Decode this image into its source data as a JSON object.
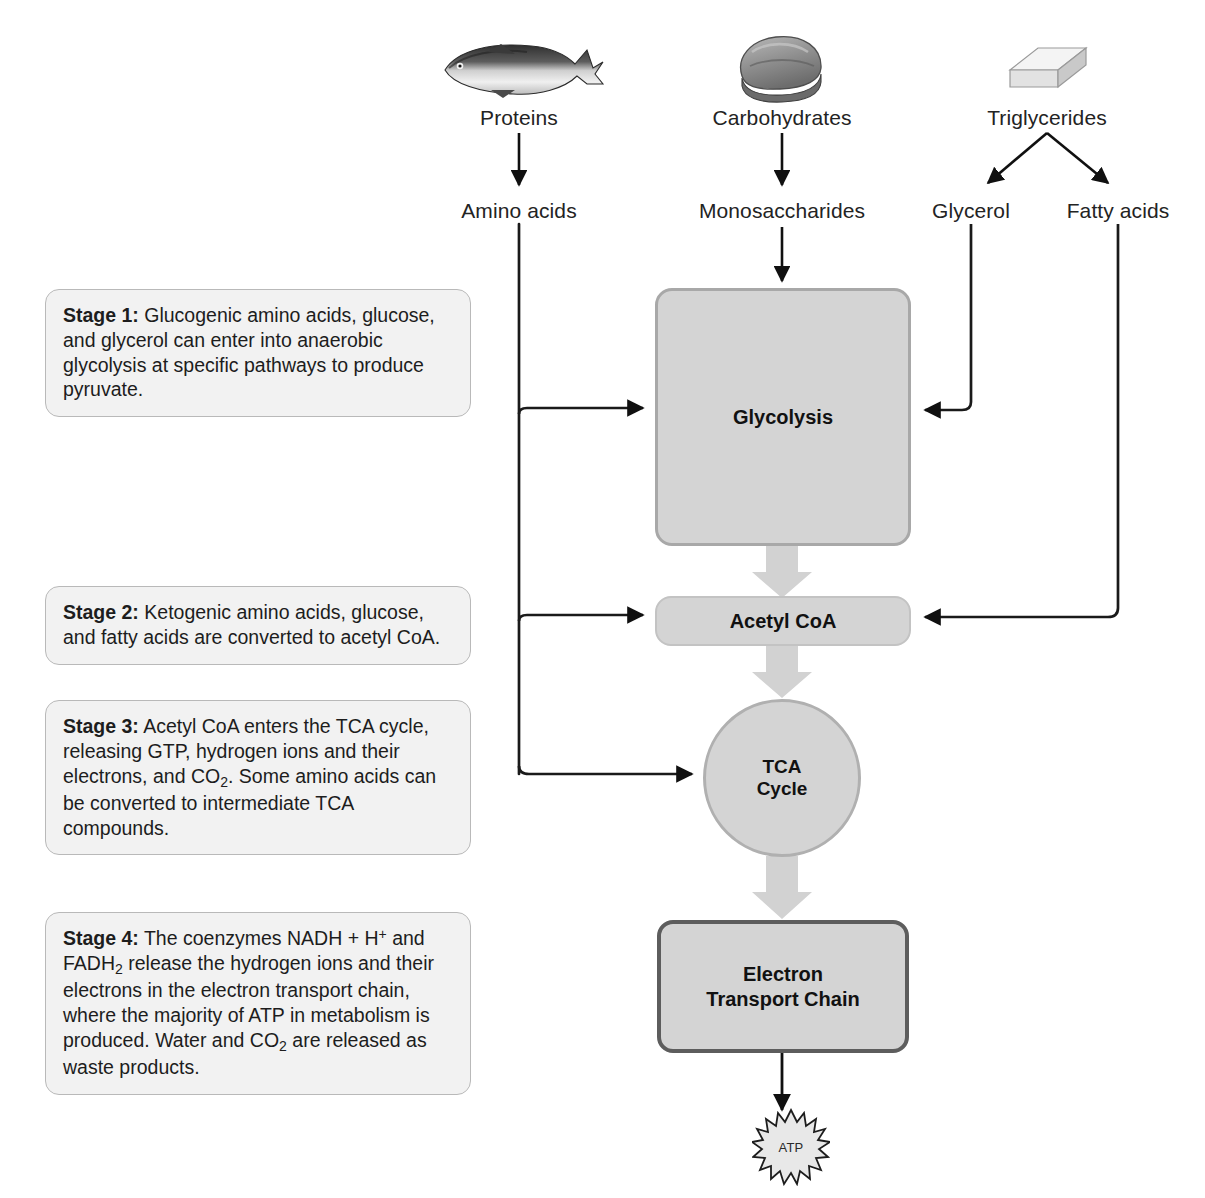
{
  "diagram": {
    "macronutrients": [
      {
        "id": "proteins",
        "label": "Proteins",
        "icon": "fish-icon"
      },
      {
        "id": "carbohydrates",
        "label": "Carbohydrates",
        "icon": "bread-icon"
      },
      {
        "id": "triglycerides",
        "label": "Triglycerides",
        "icon": "butter-icon"
      }
    ],
    "breakdown_products": [
      {
        "id": "amino-acids",
        "label": "Amino acids"
      },
      {
        "id": "monosaccharides",
        "label": "Monosaccharides"
      },
      {
        "id": "glycerol",
        "label": "Glycerol"
      },
      {
        "id": "fatty-acids",
        "label": "Fatty acids"
      }
    ],
    "nodes": {
      "glycolysis": "Glycolysis",
      "acetyl_coa": "Acetyl CoA",
      "tca_line1": "TCA",
      "tca_line2": "Cycle",
      "etc_line1": "Electron",
      "etc_line2": "Transport Chain",
      "atp": "ATP"
    },
    "stages": [
      {
        "id": "stage-1",
        "heading": "Stage 1:",
        "body": " Glucogenic amino acids, glucose, and glycerol can enter into anaerobic glycolysis at specific pathways to produce pyruvate."
      },
      {
        "id": "stage-2",
        "heading": "Stage 2:",
        "body": " Ketogenic amino acids, glucose, and fatty acids are converted to acetyl CoA."
      },
      {
        "id": "stage-3",
        "heading": "Stage 3:",
        "body_part1": " Acetyl CoA enters the TCA cycle, releasing GTP, hydrogen ions and their electrons, and CO",
        "sub1": "2",
        "body_part2": ". Some amino acids can be converted to intermediate TCA compounds."
      },
      {
        "id": "stage-4",
        "heading": "Stage 4:",
        "body_part1": " The coenzymes NADH + H",
        "sup1": "+",
        "body_part2": " and FADH",
        "sub1": "2",
        "body_part3": " release the hydrogen ions and their electrons in the electron transport chain, where the majority of ATP in metabolism is produced. Water and CO",
        "sub2": "2",
        "body_part4": " are released as waste products."
      }
    ],
    "colors": {
      "node_fill": "#d4d4d4",
      "node_border_light": "#b0b0b0",
      "node_border_dark": "#5d5d5d",
      "callout_fill": "#f2f2f2",
      "callout_border": "#b9b9b9",
      "arrow_black": "#101010",
      "arrow_gray": "#d0d0d0",
      "background": "#ffffff"
    }
  }
}
